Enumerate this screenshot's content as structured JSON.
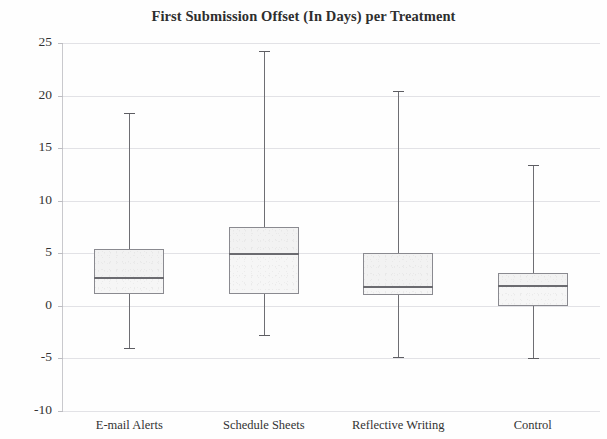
{
  "chart_data": {
    "type": "box",
    "title": "First Submission Offset (In Days) per Treatment",
    "xlabel": "",
    "ylabel": "",
    "ylim": [
      -10,
      25
    ],
    "yticks": [
      25,
      20,
      15,
      10,
      5,
      0,
      -5,
      -10
    ],
    "ytick_labels": [
      "25",
      "20",
      "15",
      "10",
      "5",
      "0",
      "-5",
      "-10"
    ],
    "grid": true,
    "legend": "none",
    "categories": [
      "E-mail Alerts",
      "Schedule Sheets",
      "Reflective Writing",
      "Control"
    ],
    "boxes": [
      {
        "category": "E-mail Alerts",
        "whisker_high": 18.3,
        "q3": 5.4,
        "median": 2.7,
        "q1": 1.1,
        "whisker_low": -4.0
      },
      {
        "category": "Schedule Sheets",
        "whisker_high": 24.2,
        "q3": 7.5,
        "median": 5.0,
        "q1": 1.1,
        "whisker_low": -2.8
      },
      {
        "category": "Reflective Writing",
        "whisker_high": 20.4,
        "q3": 5.0,
        "median": 1.9,
        "q1": 1.0,
        "whisker_low": -4.9
      },
      {
        "category": "Control",
        "whisker_high": 13.4,
        "q3": 3.1,
        "median": 2.0,
        "q1": 0.0,
        "whisker_low": -5.0
      }
    ]
  },
  "chart": {
    "title": "First Submission Offset (In Days) per Treatment"
  }
}
